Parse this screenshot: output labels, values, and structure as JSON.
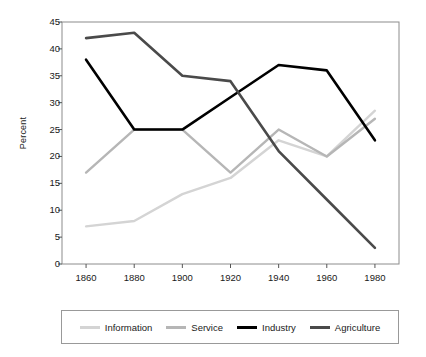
{
  "chart_data": {
    "type": "line",
    "title": "",
    "subtitle": "",
    "xlabel": "",
    "ylabel": "Percent",
    "x": [
      1860,
      1880,
      1900,
      1920,
      1940,
      1960,
      1980
    ],
    "xtick_labels": [
      "1860",
      "1880",
      "1900",
      "1920",
      "1940",
      "1960",
      "1980"
    ],
    "ytick_labels": [
      "0",
      "5",
      "10",
      "15",
      "20",
      "25",
      "30",
      "35",
      "40",
      "45"
    ],
    "yticks": [
      0,
      5,
      10,
      15,
      20,
      25,
      30,
      35,
      40,
      45
    ],
    "xlim": [
      1850,
      1990
    ],
    "ylim": [
      0,
      45
    ],
    "grid": false,
    "legend_position": "bottom",
    "series": [
      {
        "name": "Information",
        "color": "#d4d4d4",
        "values": [
          7,
          8,
          13,
          16,
          23,
          20,
          28.5
        ]
      },
      {
        "name": "Service",
        "color": "#b6b6b6",
        "values": [
          17,
          25,
          25,
          17,
          25,
          20,
          27
        ]
      },
      {
        "name": "Industry",
        "color": "#000000",
        "values": [
          38,
          25,
          25,
          31,
          37,
          36,
          23
        ]
      },
      {
        "name": "Agriculture",
        "color": "#4a4a4a",
        "values": [
          42,
          43,
          35,
          34,
          21,
          12,
          3
        ]
      }
    ]
  },
  "legend": {
    "items": [
      {
        "label": "Information",
        "color": "#d4d4d4"
      },
      {
        "label": "Service",
        "color": "#b6b6b6"
      },
      {
        "label": "Industry",
        "color": "#000000"
      },
      {
        "label": "Agriculture",
        "color": "#4a4a4a"
      }
    ]
  },
  "axes": {
    "frame_color": "#8c8c8c",
    "tick_color": "#555555",
    "text_color": "#1a1a1a"
  }
}
